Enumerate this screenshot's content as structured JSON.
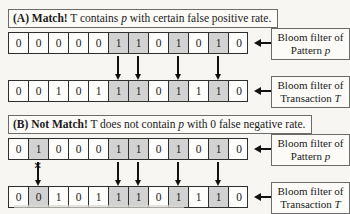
{
  "colors": {
    "background": "#f7f6f2",
    "cell_fill": "#fdfdfc",
    "shaded_cell_fill": "#d2d2d2",
    "line": "#111111",
    "box_border": "#6b6b6b"
  },
  "panels": [
    {
      "id": "A",
      "title_segments": [
        {
          "text": "(A) Match!",
          "bold": true,
          "italic": false
        },
        {
          "text": "  T contains ",
          "bold": false,
          "italic": false
        },
        {
          "text": "p",
          "bold": false,
          "italic": true
        },
        {
          "text": " with certain false positive rate.",
          "bold": false,
          "italic": false
        }
      ],
      "rows": [
        {
          "kind": "pattern",
          "bits": [
            "0",
            "0",
            "0",
            "0",
            "0",
            "1",
            "1",
            "0",
            "1",
            "0",
            "1",
            "0"
          ],
          "shaded": [
            5,
            6,
            8,
            10
          ],
          "label": {
            "line1": "Bloom filter of",
            "line2": "Pattern ",
            "line2_italic": "p"
          }
        },
        {
          "kind": "transaction",
          "bits": [
            "0",
            "0",
            "1",
            "0",
            "1",
            "1",
            "1",
            "0",
            "1",
            "1",
            "1",
            "0"
          ],
          "shaded": [
            5,
            6,
            8,
            10
          ],
          "label": {
            "line1": "Bloom filter of",
            "line2": "Transaction ",
            "line2_italic": "T"
          }
        }
      ],
      "arrows": {
        "indices": [
          5,
          6,
          8,
          10
        ],
        "crossed": []
      }
    },
    {
      "id": "B",
      "title_segments": [
        {
          "text": "(B) Not Match!",
          "bold": true,
          "italic": false
        },
        {
          "text": "  T does not contain ",
          "bold": false,
          "italic": false
        },
        {
          "text": "p",
          "bold": false,
          "italic": true
        },
        {
          "text": " with 0 false negative rate.",
          "bold": false,
          "italic": false
        }
      ],
      "rows": [
        {
          "kind": "pattern",
          "bits": [
            "0",
            "1",
            "0",
            "0",
            "0",
            "1",
            "1",
            "0",
            "1",
            "0",
            "1",
            "0"
          ],
          "shaded": [
            1,
            5,
            6,
            8,
            10
          ],
          "label": {
            "line1": "Bloom filter of",
            "line2": "Pattern ",
            "line2_italic": "p"
          }
        },
        {
          "kind": "transaction",
          "bits": [
            "0",
            "0",
            "1",
            "0",
            "1",
            "1",
            "1",
            "0",
            "1",
            "1",
            "1",
            "0"
          ],
          "shaded": [
            1,
            5,
            6,
            8,
            10
          ],
          "label": {
            "line1": "Bloom filter of",
            "line2": "Transaction ",
            "line2_italic": "T"
          }
        }
      ],
      "arrows": {
        "indices": [
          1,
          5,
          6,
          8,
          10
        ],
        "crossed": [
          1
        ]
      }
    }
  ],
  "glyphs": {
    "cross_icon": "✕"
  }
}
